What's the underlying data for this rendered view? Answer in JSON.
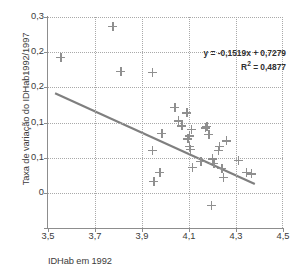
{
  "chart_data": {
    "type": "scatter",
    "title": "",
    "xlabel": "IDHab em 1992",
    "ylabel": "Taxa de variação do IDHab1992/1997",
    "xlim": [
      3.5,
      4.5
    ],
    "ylim": [
      0,
      0.3
    ],
    "x_ticks": [
      3.5,
      3.7,
      3.9,
      4.1,
      4.3,
      4.5
    ],
    "x_tick_labels": [
      "3,5",
      "3,7",
      "3,9",
      "4,1",
      "4,3",
      "4,5"
    ],
    "y_ticks": [
      0.3,
      0.25,
      0.2,
      0.15,
      0.1,
      0.05,
      0
    ],
    "y_tick_labels": [
      "0,3",
      "0,2",
      "0,2",
      "0,1",
      "0,1",
      "0"
    ],
    "y_tick_label_values": [
      0.3,
      0.25,
      0.2,
      0.15,
      0.1,
      0.05,
      0
    ],
    "grid": true,
    "legend": "none",
    "marker": "plus",
    "marker_color": "#8f8f8f",
    "trendline_color": "#7f7f7f",
    "grid_color": "#a9a9a9",
    "axis_color": "#8d8d8d",
    "points": [
      {
        "x": 3.555,
        "y": 0.243
      },
      {
        "x": 3.775,
        "y": 0.287
      },
      {
        "x": 3.81,
        "y": 0.2225
      },
      {
        "x": 3.945,
        "y": 0.221
      },
      {
        "x": 3.945,
        "y": 0.1105
      },
      {
        "x": 3.95,
        "y": 0.066
      },
      {
        "x": 3.975,
        "y": 0.079
      },
      {
        "x": 3.985,
        "y": 0.1345
      },
      {
        "x": 4.04,
        "y": 0.172
      },
      {
        "x": 4.055,
        "y": 0.1525
      },
      {
        "x": 4.07,
        "y": 0.1455
      },
      {
        "x": 4.09,
        "y": 0.164
      },
      {
        "x": 4.095,
        "y": 0.127
      },
      {
        "x": 4.1,
        "y": 0.131
      },
      {
        "x": 4.1,
        "y": 0.116
      },
      {
        "x": 4.105,
        "y": 0.1115
      },
      {
        "x": 4.11,
        "y": 0.14
      },
      {
        "x": 4.115,
        "y": 0.0865
      },
      {
        "x": 4.15,
        "y": 0.095
      },
      {
        "x": 4.17,
        "y": 0.1425
      },
      {
        "x": 4.175,
        "y": 0.1445
      },
      {
        "x": 4.185,
        "y": 0.1335
      },
      {
        "x": 4.195,
        "y": 0.032
      },
      {
        "x": 4.2,
        "y": 0.0985
      },
      {
        "x": 4.205,
        "y": 0.092
      },
      {
        "x": 4.225,
        "y": 0.1105
      },
      {
        "x": 4.23,
        "y": 0.1165
      },
      {
        "x": 4.24,
        "y": 0.0845
      },
      {
        "x": 4.245,
        "y": 0.0725
      },
      {
        "x": 4.26,
        "y": 0.124
      },
      {
        "x": 4.31,
        "y": 0.0965
      },
      {
        "x": 4.345,
        "y": 0.079
      },
      {
        "x": 4.365,
        "y": 0.077
      }
    ],
    "trendline": {
      "slope": -0.1519,
      "intercept": 0.7279,
      "x_start": 3.53,
      "x_end": 4.38,
      "equation": "y = -0,1519x + 0,7279",
      "r_squared_label": "R² = 0,4877",
      "r_squared": 0.4877
    },
    "annotations": {
      "equation_line1": "y = -0,1519x + 0,7279",
      "equation_line2_prefix": "R",
      "equation_line2_sup": "2",
      "equation_line2_rest": " = 0,4877"
    }
  }
}
